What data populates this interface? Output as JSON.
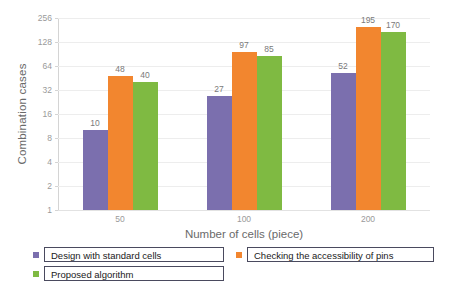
{
  "chart_data": {
    "type": "bar",
    "title": "",
    "xlabel": "Number of cells (piece)",
    "ylabel": "Combination cases",
    "categories": [
      "50",
      "100",
      "200"
    ],
    "series": [
      {
        "name": "Design with standard cells",
        "color": "#7B6FAE",
        "values": [
          10,
          27,
          52
        ]
      },
      {
        "name": "Checking the accessibility of pins",
        "color": "#F2862F",
        "values": [
          48,
          97,
          195
        ]
      },
      {
        "name": "Proposed algorithm",
        "color": "#7FBA42",
        "values": [
          40,
          85,
          170
        ]
      }
    ],
    "yscale": "log2",
    "ylim": [
      1,
      256
    ],
    "yticks": [
      1,
      2,
      4,
      8,
      16,
      32,
      64,
      128,
      256
    ],
    "ytick_labels": [
      "1",
      "2",
      "4",
      "8",
      "16",
      "32",
      "64",
      "128",
      "256"
    ],
    "grid": true,
    "legend_position": "bottom",
    "show_value_labels": true
  },
  "legend": {
    "items": [
      {
        "label": "Design with standard cells",
        "color": "#7B6FAE"
      },
      {
        "label": "Checking the accessibility of pins",
        "color": "#F2862F"
      },
      {
        "label": "Proposed algorithm",
        "color": "#7FBA42"
      }
    ]
  }
}
